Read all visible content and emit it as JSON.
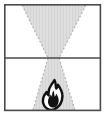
{
  "figure": {
    "type": "diagram",
    "caption": "",
    "width": 107,
    "height": 117
  },
  "colors": {
    "background": "#ffffff",
    "frame_stroke": "#4a4a4a",
    "divider_stroke": "#4a4a4a",
    "funnel_fill": "#dedede",
    "funnel_stripe": "#d2d2d2",
    "funnel_edge": "#b4b4b4",
    "flame_stroke": "#111111",
    "flame_fill": "#ffffff"
  },
  "frame": {
    "name": "outer-frame",
    "x": 4,
    "y": 4,
    "width": 97,
    "height": 107,
    "stroke_width": 1.6
  },
  "divider": {
    "name": "horizontal-divider",
    "y": 58,
    "x1": 4,
    "x2": 101,
    "stroke_width": 1.6
  },
  "funnel": {
    "name": "hourglass-funnel",
    "top_left_x": 22,
    "top_right_x": 86,
    "top_y": 5,
    "waist_left_x": 48,
    "waist_right_x": 59,
    "waist_y": 58,
    "bottom_left_x": 33,
    "bottom_right_x": 75,
    "bottom_y": 110,
    "edge_dash": "2 2",
    "edge_width": 1
  },
  "flame": {
    "name": "flame-glyph",
    "center_x": 54,
    "top_y": 80,
    "bottom_y": 110,
    "width": 22,
    "height": 30,
    "stroke_width": 2.4
  },
  "labels": {
    "upper_region": "",
    "lower_region": "",
    "flame_label": ""
  }
}
